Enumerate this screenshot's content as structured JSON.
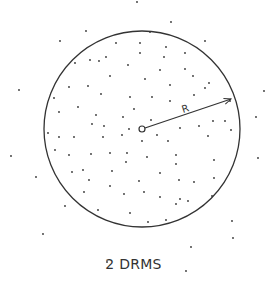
{
  "diagram": {
    "caption": "2 DRMS",
    "radius_label": "R",
    "circle": {
      "cx": 142,
      "cy": 129,
      "r": 98
    },
    "center": {
      "cx": 142,
      "cy": 129,
      "r": 3
    },
    "arrow": {
      "x1": 145,
      "y1": 128,
      "x2": 231,
      "y2": 99
    },
    "stroke_color": "#333333",
    "dots": [
      [
        137,
        2
      ],
      [
        171,
        22
      ],
      [
        86,
        31
      ],
      [
        60,
        41
      ],
      [
        205,
        41
      ],
      [
        150,
        32
      ],
      [
        116,
        43
      ],
      [
        140,
        43
      ],
      [
        166,
        47
      ],
      [
        185,
        53
      ],
      [
        140,
        53
      ],
      [
        106,
        57
      ],
      [
        99,
        61
      ],
      [
        90,
        60
      ],
      [
        164,
        57
      ],
      [
        75,
        63
      ],
      [
        185,
        69
      ],
      [
        128,
        65
      ],
      [
        160,
        70
      ],
      [
        110,
        76
      ],
      [
        193,
        76
      ],
      [
        145,
        79
      ],
      [
        209,
        83
      ],
      [
        170,
        85
      ],
      [
        69,
        87
      ],
      [
        88,
        86
      ],
      [
        205,
        88
      ],
      [
        101,
        94
      ],
      [
        19,
        90
      ],
      [
        264,
        91
      ],
      [
        194,
        95
      ],
      [
        130,
        97
      ],
      [
        152,
        97
      ],
      [
        170,
        101
      ],
      [
        230,
        101
      ],
      [
        54,
        98
      ],
      [
        78,
        107
      ],
      [
        134,
        109
      ],
      [
        59,
        112
      ],
      [
        96,
        115
      ],
      [
        256,
        117
      ],
      [
        123,
        117
      ],
      [
        151,
        120
      ],
      [
        213,
        121
      ],
      [
        92,
        124
      ],
      [
        104,
        126
      ],
      [
        199,
        126
      ],
      [
        225,
        121
      ],
      [
        180,
        128
      ],
      [
        129,
        129
      ],
      [
        48,
        133
      ],
      [
        59,
        137
      ],
      [
        157,
        135
      ],
      [
        231,
        130
      ],
      [
        208,
        136
      ],
      [
        74,
        137
      ],
      [
        103,
        137
      ],
      [
        122,
        135
      ],
      [
        168,
        141
      ],
      [
        142,
        141
      ],
      [
        55,
        150
      ],
      [
        69,
        155
      ],
      [
        91,
        154
      ],
      [
        110,
        153
      ],
      [
        127,
        153
      ],
      [
        147,
        157
      ],
      [
        176,
        155
      ],
      [
        176,
        164
      ],
      [
        214,
        160
      ],
      [
        11,
        156
      ],
      [
        258,
        158
      ],
      [
        126,
        162
      ],
      [
        72,
        172
      ],
      [
        83,
        170
      ],
      [
        112,
        171
      ],
      [
        160,
        173
      ],
      [
        89,
        180
      ],
      [
        139,
        181
      ],
      [
        179,
        180
      ],
      [
        194,
        182
      ],
      [
        214,
        178
      ],
      [
        36,
        177
      ],
      [
        110,
        186
      ],
      [
        84,
        192
      ],
      [
        124,
        194
      ],
      [
        144,
        192
      ],
      [
        160,
        197
      ],
      [
        180,
        199
      ],
      [
        188,
        201
      ],
      [
        176,
        204
      ],
      [
        212,
        196
      ],
      [
        65,
        206
      ],
      [
        98,
        210
      ],
      [
        130,
        213
      ],
      [
        148,
        222
      ],
      [
        166,
        220
      ],
      [
        232,
        221
      ],
      [
        43,
        234
      ],
      [
        233,
        238
      ],
      [
        191,
        247
      ],
      [
        107,
        262
      ],
      [
        186,
        271
      ]
    ]
  }
}
